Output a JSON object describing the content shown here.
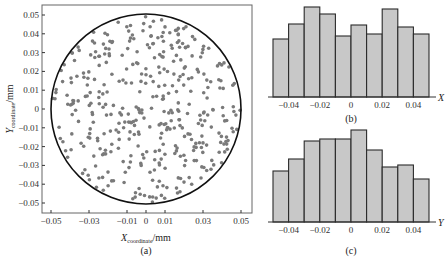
{
  "chart_data": [
    {
      "id": "a",
      "type": "scatter",
      "caption": "(a)",
      "xlabel_main": "X",
      "xlabel_sub": "coordinate",
      "xlabel_unit": "/mm",
      "ylabel_main": "Y",
      "ylabel_sub": "coordinate",
      "ylabel_unit": "/mm",
      "xlim": [
        -0.055,
        0.055
      ],
      "ylim": [
        -0.052,
        0.052
      ],
      "x_ticks": [
        "-0.05",
        "-0.03",
        "-0.01",
        "0",
        "0.01",
        "0.03",
        "0.05"
      ],
      "x_tick_values": [
        -0.05,
        -0.03,
        -0.01,
        0,
        0.01,
        0.03,
        0.05
      ],
      "y_ticks": [
        "0.05",
        "0.04",
        "0.03",
        "0.02",
        "0.01",
        "0",
        "-0.01",
        "-0.02",
        "-0.03",
        "-0.04",
        "-0.05"
      ],
      "y_tick_values": [
        0.05,
        0.04,
        0.03,
        0.02,
        0.01,
        0,
        -0.01,
        -0.02,
        -0.03,
        -0.04,
        -0.05
      ],
      "circle": {
        "cx": 0,
        "cy": 0,
        "r": 0.05
      },
      "points_description": "approx. 400 grey points uniformly distributed within a circle of radius 0.05 mm",
      "point_count_approx": 400,
      "grid": false
    },
    {
      "id": "b",
      "type": "bar",
      "caption": "(b)",
      "xlabel": "X",
      "x_ticks": [
        "-0.04",
        "-0.02",
        "0",
        "0.02",
        "0.04"
      ],
      "bin_edges": [
        -0.05,
        -0.04,
        -0.03,
        -0.02,
        -0.01,
        0,
        0.01,
        0.02,
        0.03,
        0.04,
        0.05
      ],
      "values": [
        58,
        73,
        90,
        83,
        61,
        72,
        63,
        88,
        70,
        63
      ],
      "values_note": "relative bar heights (no y-axis shown)",
      "grid": false
    },
    {
      "id": "c",
      "type": "bar",
      "caption": "(c)",
      "xlabel": "Y",
      "x_ticks": [
        "-0.04",
        "-0.02",
        "0",
        "0.02",
        "0.04"
      ],
      "bin_edges": [
        -0.05,
        -0.04,
        -0.03,
        -0.02,
        -0.01,
        0,
        0.01,
        0.02,
        0.03,
        0.04,
        0.05
      ],
      "values": [
        51,
        63,
        81,
        83,
        83,
        92,
        72,
        55,
        57,
        43
      ],
      "values_note": "relative bar heights (no y-axis shown)",
      "grid": false
    }
  ],
  "colors": {
    "point": "#7a7a7a",
    "bar_fill": "#c8c8c8",
    "bar_stroke": "#2a2a2a",
    "axis": "#333333",
    "circle": "#111111"
  }
}
